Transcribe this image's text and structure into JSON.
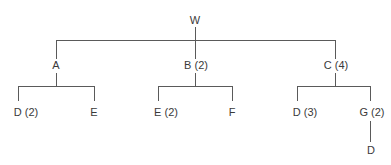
{
  "diagram": {
    "type": "tree",
    "line_color": "#5a5a5a",
    "text_color": "#3a3a3a",
    "background": "#ffffff",
    "root": {
      "label": "W",
      "children": [
        {
          "label": "A",
          "children": [
            {
              "label": "D (2)"
            },
            {
              "label": "E"
            }
          ]
        },
        {
          "label": "B (2)",
          "children": [
            {
              "label": "E (2)"
            },
            {
              "label": "F"
            }
          ]
        },
        {
          "label": "C (4)",
          "children": [
            {
              "label": "D (3)"
            },
            {
              "label": "G (2)",
              "children": [
                {
                  "label": "D"
                }
              ]
            }
          ]
        }
      ]
    }
  }
}
